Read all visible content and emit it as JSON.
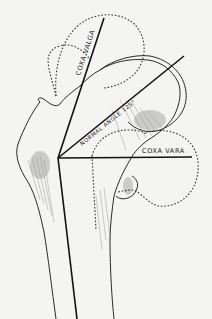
{
  "diagram": {
    "type": "anatomical-illustration",
    "labels": {
      "coxa_valga": "COXA VALGA",
      "normal_angle": "NORMAL ANGLE 125°",
      "coxa_vara": "COXA VARA"
    },
    "colors": {
      "background": "#f4f4f2",
      "ink": "#1a1a1a",
      "shading": "#8a8a8a"
    }
  }
}
